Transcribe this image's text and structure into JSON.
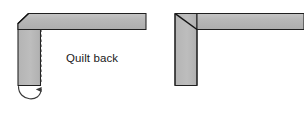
{
  "diagram": {
    "canvas": {
      "width": 304,
      "height": 114,
      "background": "#ffffff"
    },
    "colors": {
      "strip_fill": "#b0b0b0",
      "strip_fill_light": "#c2c2c2",
      "strip_fill_top": "#bdbdbd",
      "outline": "#1a1a1a",
      "dashed_line": "#333333",
      "arrow": "#3a3a3a",
      "text": "#1a1a1a"
    },
    "labels": {
      "quilt_back": "Quilt back"
    },
    "figures": [
      {
        "name": "unfolded-binding-corner",
        "description": "L-shaped binding strip with chamfered open corner, dashed fold line and curved fold-up arrow",
        "horizontal_strip": {
          "x": 18,
          "y": 13,
          "width": 128,
          "height": 16
        },
        "vertical_strip": {
          "x": 18,
          "y": 13,
          "width": 22,
          "height": 72
        },
        "chamfer": "45-degree cut at top-left corner",
        "fold_line": {
          "style": "dashed",
          "x": 41,
          "y_start": 29,
          "y_end": 86
        },
        "fold_arrow": {
          "style": "curved",
          "direction": "counterclockwise-up",
          "arrowhead": "up"
        }
      },
      {
        "name": "folded-binding-corner",
        "description": "L-shaped binding strip with square corner showing 45-degree mitered seam",
        "horizontal_strip": {
          "x": 175,
          "y": 13,
          "width": 129,
          "height": 16
        },
        "vertical_strip": {
          "x": 175,
          "y": 13,
          "width": 22,
          "height": 72
        },
        "miter_seam": "45-degree diagonal from outer corner to inner corner"
      }
    ]
  }
}
